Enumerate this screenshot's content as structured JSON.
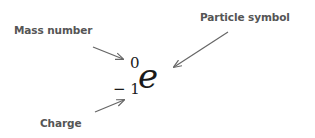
{
  "labels": {
    "mass_number": "Mass number",
    "particle_symbol": "Particle symbol",
    "charge": "Charge"
  },
  "notation": {
    "symbol": "e",
    "mass_number": "0",
    "charge": "− 1"
  },
  "colors": {
    "label_text": "#555555",
    "arrow": "#666666",
    "symbol": "#1a1a1a"
  }
}
